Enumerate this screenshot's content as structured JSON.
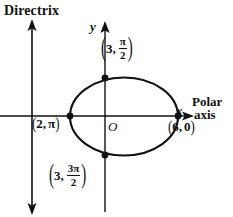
{
  "figure": {
    "directrix_label": "Directrix",
    "axes": {
      "y_letter": "y",
      "x_letter": "x",
      "origin_letter": "O",
      "polar_axis_line1": "Polar",
      "polar_axis_line2": "axis"
    },
    "colors": {
      "stroke": "#111111",
      "background": "#ffffff"
    },
    "points": [
      {
        "name": "point-top",
        "r": "3",
        "theta_num": "π",
        "theta_den": "2",
        "label": "(3, π/2)",
        "x_px": 105,
        "y_px": 78
      },
      {
        "name": "point-left",
        "r": "2",
        "theta_num": "π",
        "theta_den": "",
        "label": "(2, π)",
        "x_px": 70,
        "y_px": 116
      },
      {
        "name": "point-right",
        "r": "6",
        "theta_num": "0",
        "theta_den": "",
        "label": "(6, 0)",
        "x_px": 178,
        "y_px": 116
      },
      {
        "name": "point-bottom",
        "r": "3",
        "theta_num": "3π",
        "theta_den": "2",
        "label": "(3, 3π/2)",
        "x_px": 105,
        "y_px": 155
      }
    ],
    "punctuation": {
      "open_paren": "(",
      "close_paren": ")",
      "comma": ","
    }
  }
}
